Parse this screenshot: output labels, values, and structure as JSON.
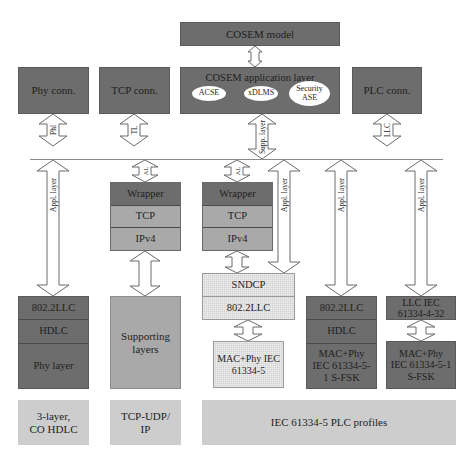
{
  "top": {
    "cosem_model": "COSEM model",
    "cosem_app_layer": {
      "title": "COSEM application layer",
      "services": [
        "ACSE",
        "xDLMS",
        "Security ASE"
      ]
    },
    "connection_managers": {
      "phy": "Phy conn.",
      "tcp": "TCP conn.",
      "plc": "PLC conn."
    }
  },
  "arrow_labels": {
    "phl": "Phl",
    "tl": "TL",
    "supp_layer": "Supp. layer",
    "llc": "LLC",
    "appl_layer": "Appl. layer"
  },
  "stacks": {
    "three_layer": [
      "802.2LLC",
      "HDLC",
      "Phy layer"
    ],
    "tcp_wrapper": [
      "Wrapper",
      "TCP",
      "IPv4"
    ],
    "supporting_layers": "Supporting layers",
    "gprs_wrapper": [
      "Wrapper",
      "TCP",
      "IPv4"
    ],
    "sndcp": [
      "SNDCP",
      "802.2LLC"
    ],
    "mac_phy_iec": "MAC+Phy IEC 61334-5",
    "sfsk_hdlc": [
      "802.2LLC",
      "HDLC",
      "MAC+Phy IEC 61334-5-1 S-FSK"
    ],
    "llc_432": "LLC IEC 61334-4-32",
    "mac_phy_sfsk": "MAC+Phy IEC 61334-5-1 S-FSK"
  },
  "profiles": {
    "three_layer": "3-layer, CO HDLC",
    "tcp_udp": "TCP-UDP/ IP",
    "plc": "IEC 61334-5 PLC profiles"
  },
  "colors": {
    "dark": "#6d6d6d",
    "mid": "#8f8f8f",
    "light": "#a9a9a9",
    "pale": "#cdcdcd",
    "hatch": "#d3d3d3"
  }
}
